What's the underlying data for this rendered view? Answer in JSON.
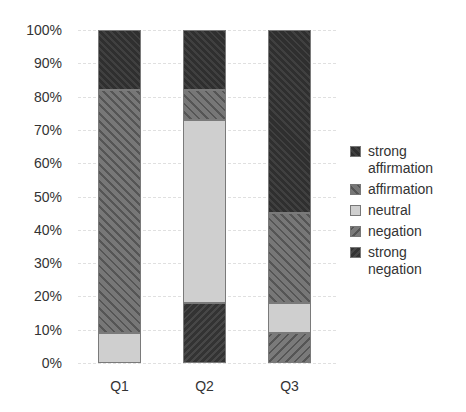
{
  "chart_data": {
    "type": "bar",
    "stacked": true,
    "percent": true,
    "title": "",
    "xlabel": "",
    "ylabel": "",
    "ylim": [
      0,
      100
    ],
    "yticks": [
      "0%",
      "10%",
      "20%",
      "30%",
      "40%",
      "50%",
      "60%",
      "70%",
      "80%",
      "90%",
      "100%"
    ],
    "categories": [
      "Q1",
      "Q2",
      "Q3"
    ],
    "series": [
      {
        "name": "strong negation",
        "values": [
          0,
          18,
          0
        ],
        "pattern": "dark, / hatch"
      },
      {
        "name": "negation",
        "values": [
          0,
          0,
          9
        ],
        "pattern": "medium gray, / hatch"
      },
      {
        "name": "neutral",
        "values": [
          9,
          55,
          9
        ],
        "pattern": "light gray, solid"
      },
      {
        "name": "affirmation",
        "values": [
          73,
          9,
          27
        ],
        "pattern": "medium gray, \\ hatch"
      },
      {
        "name": "strong affirmation",
        "values": [
          18,
          18,
          55
        ],
        "pattern": "dark, \\ hatch"
      }
    ],
    "legend": {
      "position": "right",
      "entries": [
        "strong affirmation",
        "affirmation",
        "neutral",
        "negation",
        "strong negation"
      ]
    },
    "grid": true
  },
  "legend_labels": {
    "strong_affirmation": "strong affirmation",
    "affirmation": "affirmation",
    "neutral": "neutral",
    "negation": "negation",
    "strong_negation": "strong negation"
  }
}
